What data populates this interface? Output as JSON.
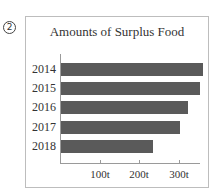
{
  "figure_number": "2",
  "chart_data": {
    "type": "bar",
    "orientation": "horizontal",
    "title": "Amounts of Surplus Food",
    "categories": [
      "2014",
      "2015",
      "2016",
      "2017",
      "2018"
    ],
    "values": [
      360,
      352,
      322,
      300,
      233
    ],
    "unit": "t",
    "xlabel": "",
    "ylabel": "",
    "xlim": [
      0,
      355
    ],
    "x_ticks": [
      "100t",
      "200t",
      "300t"
    ],
    "x_tick_values": [
      100,
      200,
      300
    ],
    "grid": false,
    "legend": null,
    "bar_color": "#5a5a5a"
  }
}
